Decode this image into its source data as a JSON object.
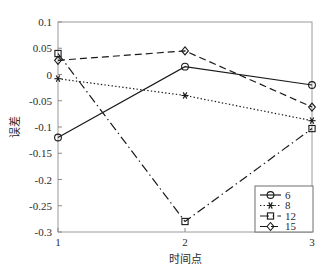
{
  "chart_data": {
    "type": "line",
    "title": "",
    "xlabel": "时间点",
    "ylabel": "误差",
    "x": [
      1,
      2,
      3
    ],
    "categories": [
      "1",
      "2",
      "3"
    ],
    "xlim": [
      1,
      3
    ],
    "ylim": [
      -0.3,
      0.1
    ],
    "grid": false,
    "legend_position": "lower-right",
    "xticks": [
      "1",
      "2",
      "3"
    ],
    "yticks": [
      "0.1",
      "0.05",
      "0",
      "-0.05",
      "-0.1",
      "-0.15",
      "-0.2",
      "-0.25",
      "-0.3"
    ],
    "ytick_values": [
      0.1,
      0.05,
      0,
      -0.05,
      -0.1,
      -0.15,
      -0.2,
      -0.25,
      -0.3
    ],
    "series": [
      {
        "name": "6",
        "values": [
          -0.12,
          0.015,
          -0.02
        ],
        "linestyle": "solid",
        "marker": "circle",
        "color": "#1a1a1a"
      },
      {
        "name": "8",
        "values": [
          -0.008,
          -0.04,
          -0.088
        ],
        "linestyle": "dotted",
        "marker": "asterisk",
        "color": "#1a1a1a"
      },
      {
        "name": "12",
        "values": [
          0.04,
          -0.28,
          -0.103
        ],
        "linestyle": "dashdot",
        "marker": "square",
        "color": "#1a1a1a"
      },
      {
        "name": "15",
        "values": [
          0.027,
          0.045,
          -0.062
        ],
        "linestyle": "dashed",
        "marker": "diamond",
        "color": "#1a1a1a"
      }
    ]
  },
  "axes": {
    "x_title": "时间点",
    "y_title": "误差"
  },
  "legend": {
    "entries": [
      {
        "label": "6"
      },
      {
        "label": "8"
      },
      {
        "label": "12"
      },
      {
        "label": "15"
      }
    ]
  },
  "colors": {
    "frame": "#9a9a9a",
    "line": "#1a1a1a",
    "text": "#2b2b2b",
    "background": "#ffffff"
  }
}
